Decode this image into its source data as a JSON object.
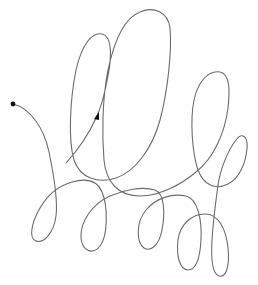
{
  "figure": {
    "type": "single continuous looping curve",
    "stroke_color": "#6b6b6b",
    "marker_color": "#111111",
    "background": "#ffffff",
    "start_marker": {
      "shape": "filled-circle",
      "x": 13,
      "y": 104,
      "r": 2.4
    },
    "direction_arrow": {
      "shape": "filled-triangle",
      "x": 96,
      "y": 117,
      "heading": "up-right"
    },
    "curve_path": "M13,104 C30,108 45,130 51,160 C56,185 58,205 54,222 C50,238 38,244 34,237 C30,226 40,200 57,190 C72,181 92,178 100,193 C108,210 108,240 95,248 C85,254 80,244 81,232 C82,212 100,196 130,191 C150,188 160,195 163,213 C165,235 158,250 148,248 C138,246 135,225 148,210 C160,196 180,192 192,205 C202,217 202,250 194,265 C188,278 181,265 181,250 C181,225 190,212 207,215 C222,217 230,240 230,255 C231,275 225,280 219,272 C212,262 214,230 220,200 C224,178 232,150 236,115 C237,95 234,75 222,78 C208,82 202,110 202,135 C202,165 212,182 222,185 C235,188 242,175 242,155 C242,95 255,160 220,155 M220,155 C205,170 185,190 170,180 C160,170 175,130 178,100 C180,80 180,60 162,62 C148,64 138,90 140,125 C142,160 125,185 105,190 C85,195 72,175 72,140 C72,100 80,45 85,20 C90,5 115,0 120,15 C125,35 118,70 110,95 C103,118 86,145 66,163",
    "loops": [
      {
        "label": "tall loop left",
        "top": [
          103,
          40
        ]
      },
      {
        "label": "tallest loop",
        "top": [
          162,
          10
        ]
      },
      {
        "label": "mid loop right",
        "top": [
          222,
          72
        ]
      },
      {
        "label": "small loop far right",
        "top": [
          244,
          138
        ]
      },
      {
        "label": "bottom loop 1",
        "bottom": [
          34,
          237
        ]
      },
      {
        "label": "bottom loop 2",
        "bottom": [
          93,
          250
        ]
      },
      {
        "label": "bottom loop 3",
        "bottom": [
          148,
          248
        ]
      },
      {
        "label": "bottom loop 4",
        "bottom": [
          185,
          272
        ]
      },
      {
        "label": "bottom loop 5",
        "bottom": [
          222,
          275
        ]
      }
    ]
  }
}
